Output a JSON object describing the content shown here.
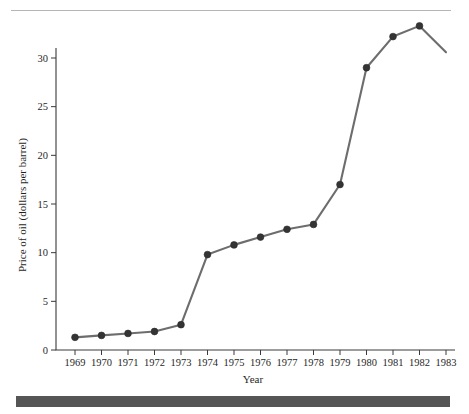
{
  "figure": {
    "top_rule": "horizontal-rule",
    "bottom_bar": "dark-footer-bar"
  },
  "chart_data": {
    "type": "line",
    "title": "",
    "xlabel": "Year",
    "ylabel": "Price of oil (dollars per barrel)",
    "x": [
      1969,
      1970,
      1971,
      1972,
      1973,
      1974,
      1975,
      1976,
      1977,
      1978,
      1979,
      1980,
      1981,
      1982,
      1983
    ],
    "values": [
      1.3,
      1.5,
      1.7,
      1.9,
      2.6,
      9.8,
      10.8,
      11.6,
      12.4,
      12.9,
      17.0,
      29.0,
      32.2,
      33.3,
      30.6
    ],
    "markers": [
      true,
      true,
      true,
      true,
      true,
      true,
      true,
      true,
      true,
      true,
      true,
      true,
      true,
      true,
      false
    ],
    "xlim": [
      1968.6,
      1983.4
    ],
    "ylim": [
      0,
      34.6
    ],
    "xticks": [
      "1969",
      "1970",
      "1971",
      "1972",
      "1973",
      "1974",
      "1975",
      "1976",
      "1977",
      "1978",
      "1979",
      "1980",
      "1981",
      "1982",
      "1983"
    ],
    "yticks": [
      "0",
      "5",
      "10",
      "15",
      "20",
      "25",
      "30"
    ],
    "ytick_values": [
      0,
      5,
      10,
      15,
      20,
      25,
      30
    ],
    "grid": false,
    "legend": "none",
    "line_color": "#6d6d6d",
    "marker_color": "#343434",
    "axis_color": "#3a3a3a"
  }
}
